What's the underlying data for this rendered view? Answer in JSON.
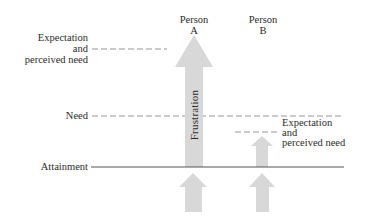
{
  "diagram": {
    "persons": [
      {
        "line1": "Person",
        "line2": "A"
      },
      {
        "line1": "Person",
        "line2": "B"
      }
    ],
    "left_labels": {
      "expectation": {
        "line1": "Expectation",
        "line2": "and",
        "line3": "perceived need"
      },
      "need": "Need",
      "attainment": "Attainment"
    },
    "right_label": {
      "line1": "Expectation",
      "line2": "and",
      "line3": "perceived need"
    },
    "arrow_label": "Frustration",
    "colors": {
      "arrow": "#d8d8d8",
      "dashed_line": "#8a8a8a",
      "solid_line": "#555555",
      "text": "#2b2b2b"
    }
  }
}
